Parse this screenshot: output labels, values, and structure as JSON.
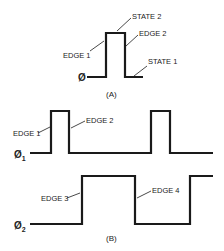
{
  "figure_a": {
    "caption": "(A)",
    "signal_label": "Ø",
    "labels": {
      "state2": "STATE 2",
      "edge2": "EDGE 2",
      "edge1": "EDGE 1",
      "state1": "STATE 1"
    }
  },
  "figure_b": {
    "caption": "(B)",
    "phi1_label": "Ø",
    "phi1_sub": "1",
    "phi2_label": "Ø",
    "phi2_sub": "2",
    "labels": {
      "edge1": "EDGE 1",
      "edge2": "EDGE 2",
      "edge3": "EDGE 3",
      "edge4": "EDGE 4"
    }
  }
}
